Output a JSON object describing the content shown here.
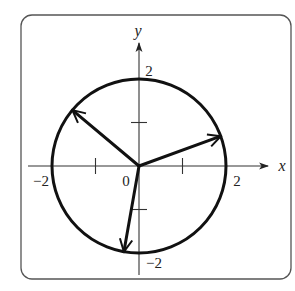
{
  "figure": {
    "type": "complex-plane-roots",
    "axes": {
      "x_label": "x",
      "y_label": "y",
      "origin_label": "0",
      "x_tick_labels": [
        "−2",
        "2"
      ],
      "y_tick_labels": [
        "2",
        "−2"
      ],
      "x_range": [
        -2,
        2
      ],
      "y_range": [
        -2,
        2
      ],
      "minor_ticks": [
        -1,
        1
      ]
    },
    "circle": {
      "center": [
        0,
        0
      ],
      "radius": 2
    },
    "vectors": [
      {
        "name": "vector-20deg",
        "angle_deg": 20,
        "length": 2
      },
      {
        "name": "vector-140deg",
        "angle_deg": 140,
        "length": 2
      },
      {
        "name": "vector-260deg",
        "angle_deg": 260,
        "length": 2
      }
    ],
    "colors": {
      "stroke": "#111111",
      "frame": "#555555",
      "axis": "#333333",
      "background": "#ffffff"
    }
  }
}
